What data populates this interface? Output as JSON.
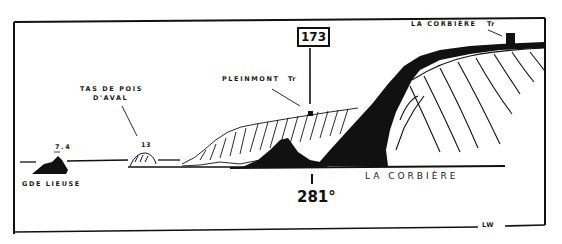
{
  "diagram": {
    "type": "coastal-view-sketch",
    "labels": {
      "rock_left_height": "7.4",
      "rock_left_name": "GDE LIEUSE",
      "tas_line1": "TAS DE POIS",
      "tas_line2": "D'AVAL",
      "tas_height": "13",
      "pleinmont": "PLEINMONT",
      "pleinmont_tr": "Tr",
      "la_corbiere_top": "LA CORBIÈRE",
      "la_corbiere_tr": "Tr",
      "la_corbiere_bottom": "LA CORBIÈRE",
      "page_ref": "173",
      "bearing": "281°",
      "lw": "LW"
    },
    "colors": {
      "ink": "#111111",
      "paper": "#ffffff"
    }
  }
}
